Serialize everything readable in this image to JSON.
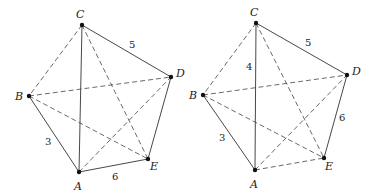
{
  "graphs": [
    {
      "id": "left",
      "vertices": [
        {
          "name": "C",
          "x": 82,
          "y": 25,
          "lx": 76,
          "ly": 18
        },
        {
          "name": "B",
          "x": 29,
          "y": 96,
          "lx": 15,
          "ly": 100
        },
        {
          "name": "A",
          "x": 79,
          "y": 172,
          "lx": 74,
          "ly": 190
        },
        {
          "name": "E",
          "x": 148,
          "y": 159,
          "lx": 150,
          "ly": 170
        },
        {
          "name": "D",
          "x": 171,
          "y": 77,
          "lx": 176,
          "ly": 77
        }
      ],
      "edges": [
        {
          "from": "C",
          "to": "D",
          "style": "solid",
          "weight": "5",
          "wx": 129,
          "wy": 48
        },
        {
          "from": "C",
          "to": "A",
          "style": "solid",
          "weight": ""
        },
        {
          "from": "B",
          "to": "A",
          "style": "solid",
          "weight": "3",
          "wx": 45,
          "wy": 145
        },
        {
          "from": "A",
          "to": "E",
          "style": "solid",
          "weight": "6",
          "wx": 112,
          "wy": 180
        },
        {
          "from": "D",
          "to": "E",
          "style": "solid",
          "weight": ""
        },
        {
          "from": "C",
          "to": "B",
          "style": "dashed",
          "weight": ""
        },
        {
          "from": "C",
          "to": "E",
          "style": "dashed",
          "weight": ""
        },
        {
          "from": "B",
          "to": "D",
          "style": "dashed",
          "weight": ""
        },
        {
          "from": "B",
          "to": "E",
          "style": "dashed",
          "weight": ""
        },
        {
          "from": "A",
          "to": "D",
          "style": "dashed",
          "weight": ""
        }
      ]
    },
    {
      "id": "right",
      "vertices": [
        {
          "name": "C",
          "x": 256,
          "y": 23,
          "lx": 250,
          "ly": 16
        },
        {
          "name": "B",
          "x": 203,
          "y": 95,
          "lx": 189,
          "ly": 99
        },
        {
          "name": "A",
          "x": 255,
          "y": 170,
          "lx": 250,
          "ly": 188
        },
        {
          "name": "E",
          "x": 324,
          "y": 158,
          "lx": 325,
          "ly": 170
        },
        {
          "name": "D",
          "x": 347,
          "y": 75,
          "lx": 352,
          "ly": 75
        }
      ],
      "edges": [
        {
          "from": "C",
          "to": "D",
          "style": "solid",
          "weight": "5",
          "wx": 305,
          "wy": 46
        },
        {
          "from": "C",
          "to": "A",
          "style": "solid",
          "weight": "4",
          "wx": 246,
          "wy": 70
        },
        {
          "from": "B",
          "to": "A",
          "style": "solid",
          "weight": "3",
          "wx": 219,
          "wy": 141
        },
        {
          "from": "D",
          "to": "E",
          "style": "solid",
          "weight": "6",
          "wx": 339,
          "wy": 121
        },
        {
          "from": "C",
          "to": "B",
          "style": "dashed",
          "weight": ""
        },
        {
          "from": "C",
          "to": "E",
          "style": "dashed",
          "weight": ""
        },
        {
          "from": "B",
          "to": "D",
          "style": "dashed",
          "weight": ""
        },
        {
          "from": "B",
          "to": "E",
          "style": "dashed",
          "weight": ""
        },
        {
          "from": "A",
          "to": "D",
          "style": "dashed",
          "weight": ""
        },
        {
          "from": "A",
          "to": "E",
          "style": "dashed",
          "weight": ""
        }
      ]
    }
  ]
}
